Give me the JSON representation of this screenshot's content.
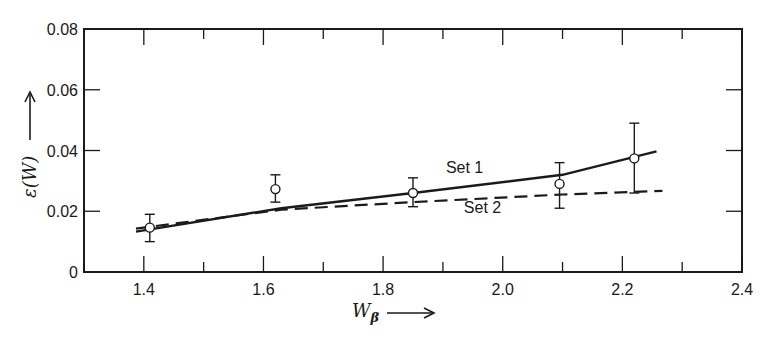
{
  "chart_data": {
    "type": "line",
    "title": "",
    "xlabel": "W_β",
    "ylabel": "ε(W)",
    "xlim": [
      1.3,
      2.4
    ],
    "ylim": [
      0,
      0.08
    ],
    "grid": false,
    "legend": "inline labels",
    "x_ticks": [
      1.4,
      1.6,
      1.8,
      2.0,
      2.2,
      2.4
    ],
    "x_tick_labels": [
      "1.4",
      "1.6",
      "1.8",
      "2.0",
      "2.2",
      "2.4"
    ],
    "x_minor_ticks": [
      1.5,
      1.7,
      1.9,
      2.1,
      2.3
    ],
    "y_ticks": [
      0,
      0.02,
      0.04,
      0.06,
      0.08
    ],
    "y_tick_labels": [
      "0",
      "0.02",
      "0.04",
      "0.06",
      "0.08"
    ],
    "points": {
      "name": "Measured",
      "marker": "open-circle",
      "x": [
        1.41,
        1.62,
        1.85,
        2.095,
        2.22
      ],
      "y": [
        0.0146,
        0.0273,
        0.026,
        0.029,
        0.0374
      ],
      "err_low": [
        0.01,
        0.023,
        0.0215,
        0.021,
        0.026
      ],
      "err_high": [
        0.019,
        0.032,
        0.031,
        0.036,
        0.049
      ]
    },
    "series": [
      {
        "name": "Set 1",
        "style": "solid",
        "x": [
          1.387,
          1.63,
          1.85,
          2.1,
          2.257
        ],
        "y": [
          0.0133,
          0.021,
          0.026,
          0.032,
          0.0397
        ]
      },
      {
        "name": "Set 2",
        "style": "dashed",
        "x": [
          1.387,
          1.63,
          1.85,
          2.1,
          2.267
        ],
        "y": [
          0.0143,
          0.0205,
          0.023,
          0.0255,
          0.0267
        ]
      }
    ],
    "annotations": [
      {
        "text": "Set 1",
        "x": 1.905,
        "y": 0.0325
      },
      {
        "text": "Set 2",
        "x": 1.935,
        "y": 0.0195
      }
    ]
  },
  "labels": {
    "xlabel_main": "W",
    "xlabel_sub": "β",
    "ylabel": "ε(W)"
  }
}
